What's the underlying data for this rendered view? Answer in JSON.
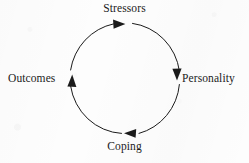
{
  "diagram": {
    "type": "cyclical-process",
    "direction": "clockwise",
    "background_color": "#fdfdfd",
    "stroke_color": "#1b1b1b",
    "nodes": [
      {
        "id": "stressors",
        "label": "Stressors",
        "position": "top"
      },
      {
        "id": "personality",
        "label": "Personality",
        "position": "right"
      },
      {
        "id": "coping",
        "label": "Coping",
        "position": "bottom"
      },
      {
        "id": "outcomes",
        "label": "Outcomes",
        "position": "left"
      }
    ],
    "arrows": [
      {
        "id": "arrow-top",
        "icon": "arrowhead-right-icon",
        "points": "right",
        "at": "top"
      },
      {
        "id": "arrow-right",
        "icon": "arrowhead-down-icon",
        "points": "down",
        "at": "right"
      },
      {
        "id": "arrow-bottom",
        "icon": "arrowhead-left-icon",
        "points": "left",
        "at": "bottom"
      },
      {
        "id": "arrow-left",
        "icon": "arrowhead-up-icon",
        "points": "up",
        "at": "left"
      }
    ],
    "flow_sequence": [
      "Stressors",
      "Personality",
      "Coping",
      "Outcomes"
    ]
  }
}
